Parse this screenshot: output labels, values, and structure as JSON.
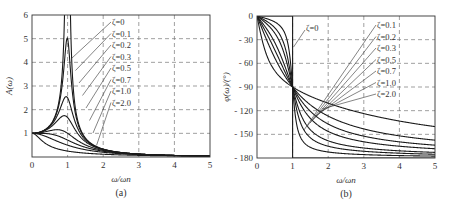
{
  "chart_data": [
    {
      "type": "line",
      "panel": "a",
      "caption": "(a)",
      "title": "",
      "xlabel": "ω/ωn",
      "ylabel": "A(ω)",
      "xlim": [
        0,
        5
      ],
      "ylim": [
        0,
        6
      ],
      "xticks": [
        "0",
        "1",
        "2",
        "3",
        "4",
        "5"
      ],
      "yticks": [
        "1",
        "2",
        "3",
        "4",
        "5",
        "6"
      ],
      "grid": "dashed",
      "formula": "A = 1/sqrt((1-r^2)^2 + (2*zeta*r)^2)",
      "series": [
        {
          "name": "ζ=0",
          "zeta": 0,
          "peak": "infinite at ω/ωn=1"
        },
        {
          "name": "ζ=0.1",
          "zeta": 0.1,
          "peak": 5.03
        },
        {
          "name": "ζ=0.2",
          "zeta": 0.2,
          "peak": 2.55
        },
        {
          "name": "ζ=0.3",
          "zeta": 0.3,
          "peak": 1.75
        },
        {
          "name": "ζ=0.5",
          "zeta": 0.5,
          "peak": 1.15
        },
        {
          "name": "ζ=0.7",
          "zeta": 0.7,
          "peak": 1.0
        },
        {
          "name": "ζ=1.0",
          "zeta": 1.0,
          "peak": 1.0
        },
        {
          "name": "ζ=2.0",
          "zeta": 2.0,
          "peak": 1.0
        }
      ],
      "legend": [
        "ζ=0",
        "ζ=0.1",
        "ζ=0.2",
        "ζ=0.3",
        "ζ=0.5",
        "ζ=0.7",
        "ζ=1.0",
        "ζ=2.0"
      ]
    },
    {
      "type": "line",
      "panel": "b",
      "caption": "(b)",
      "title": "",
      "xlabel": "ω/ωn",
      "ylabel": "φ(ω)/(°)",
      "xlim": [
        0,
        5
      ],
      "ylim": [
        -180,
        0
      ],
      "xticks": [
        "0",
        "1",
        "2",
        "3",
        "4",
        "5"
      ],
      "yticks": [
        "0",
        "-30",
        "-60",
        "-90",
        "-120",
        "-150",
        "-180"
      ],
      "grid": "dashed",
      "formula": "phi = -atan2(2*zeta*r, 1-r^2) in degrees",
      "series": [
        {
          "name": "ζ=0",
          "zeta": 0,
          "note": "0° for r<1, -180° for r>1"
        },
        {
          "name": "ζ=0.1",
          "zeta": 0.1,
          "at_r1": -90
        },
        {
          "name": "ζ=0.2",
          "zeta": 0.2,
          "at_r1": -90
        },
        {
          "name": "ζ=0.3",
          "zeta": 0.3,
          "at_r1": -90
        },
        {
          "name": "ζ=0.5",
          "zeta": 0.5,
          "at_r1": -90
        },
        {
          "name": "ζ=0.7",
          "zeta": 0.7,
          "at_r1": -90
        },
        {
          "name": "ζ=1.0",
          "zeta": 1.0,
          "at_r1": -90
        },
        {
          "name": "ζ=2.0",
          "zeta": 2.0,
          "at_r1": -90
        }
      ],
      "legend": [
        "ζ=0",
        "ζ=0.1",
        "ζ=0.2",
        "ζ=0.3",
        "ζ=0.5",
        "ζ=0.7",
        "ζ=1.0",
        "ζ=2.0"
      ]
    }
  ]
}
